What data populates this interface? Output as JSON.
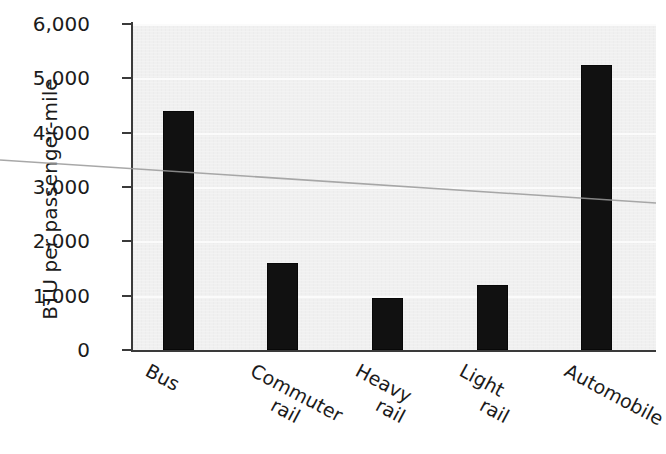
{
  "chart_data": {
    "type": "bar",
    "title": "",
    "xlabel": "",
    "ylabel": "BTU per passenger-mile",
    "categories": [
      "Bus",
      "Commuter rail",
      "Heavy rail",
      "Light rail",
      "Automobile"
    ],
    "values": [
      4400,
      1600,
      950,
      1200,
      5250
    ],
    "ylim": [
      0,
      6000
    ],
    "ytick_values": [
      0,
      1000,
      2000,
      3000,
      4000,
      5000,
      6000
    ],
    "ytick_labels": [
      "0",
      "1,000",
      "2,000",
      "3,000",
      "4,000",
      "5,000",
      "6,000"
    ],
    "grid": true,
    "grid_axis": "y",
    "legend": false,
    "bar_color": "#111111",
    "plot_background": "#f0f0f0",
    "axis_color": "#3a3a3a",
    "annotations": [
      {
        "name": "scan-crease-line",
        "description": "faint diagonal scan crease spanning full image width",
        "color": "#9a9a9a"
      }
    ]
  },
  "axis": {
    "y_title": "BTU per passenger-mile"
  },
  "xlabels": [
    {
      "line1": "Bus",
      "line2": ""
    },
    {
      "line1": "Commuter",
      "line2": "rail"
    },
    {
      "line1": "Heavy",
      "line2": "rail"
    },
    {
      "line1": "Light",
      "line2": "rail"
    },
    {
      "line1": "Automobile",
      "line2": ""
    }
  ]
}
